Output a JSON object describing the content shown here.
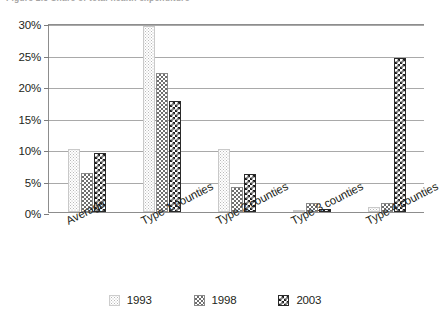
{
  "caption": {
    "text": "Figure 2.3  Share of total health expenditure"
  },
  "chart_data": {
    "type": "bar",
    "title": "",
    "xlabel": "",
    "ylabel": "",
    "ylim": [
      0,
      30
    ],
    "ytick_values": [
      0,
      5,
      10,
      15,
      20,
      25,
      30
    ],
    "ytick_labels": [
      "0%",
      "5%",
      "10%",
      "15%",
      "20%",
      "25%",
      "30%"
    ],
    "grid": true,
    "legend_position": "bottom",
    "categories": [
      "Average",
      "Type 1 counties",
      "Type 2 counties",
      "Type 3 counties",
      "Type 4 counties"
    ],
    "series": [
      {
        "name": "1993",
        "swatch": "light-dotted",
        "values": [
          10.0,
          29.5,
          10.0,
          0.3,
          0.8
        ]
      },
      {
        "name": "1998",
        "swatch": "gray-checkered",
        "values": [
          6.2,
          22.0,
          4.0,
          1.5,
          1.5
        ]
      },
      {
        "name": "2003",
        "swatch": "dark-checkered",
        "values": [
          9.3,
          17.7,
          6.1,
          0.4,
          24.5
        ]
      }
    ]
  }
}
